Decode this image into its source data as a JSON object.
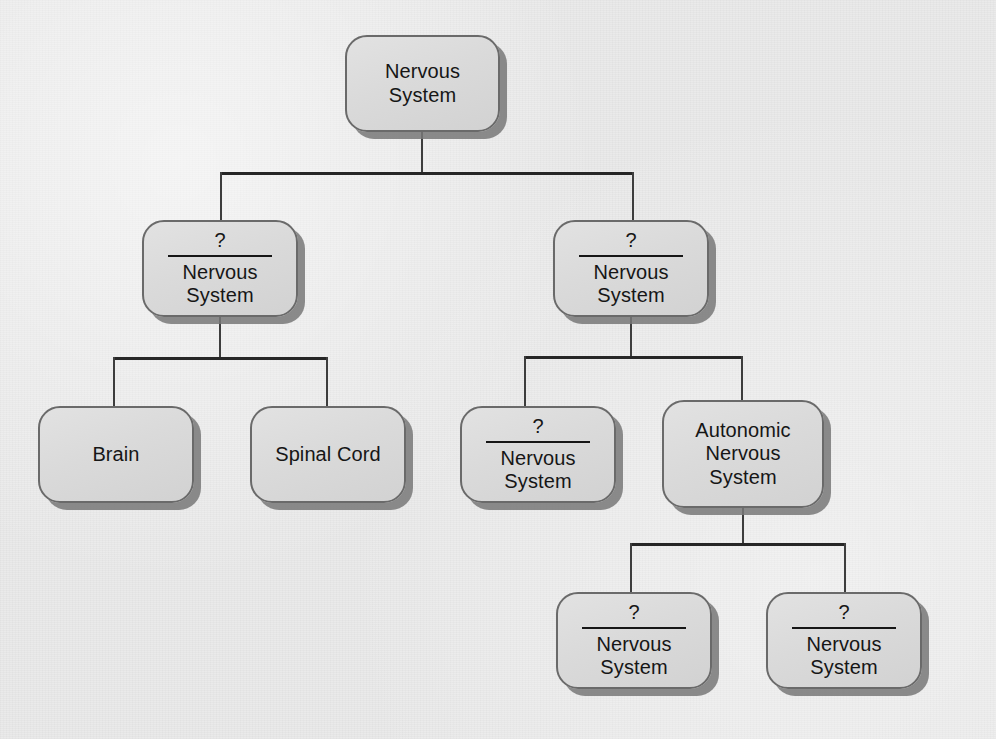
{
  "diagram": {
    "background_color": "#eaeaea",
    "node_fill_color": "#dcdcdc",
    "node_border_color": "#6a6a6a",
    "node_shadow_color": "#787878",
    "connector_color": "#262626",
    "text_color": "#161616",
    "blank_marker": "?",
    "nodes": [
      {
        "id": "root",
        "label": "Nervous\nSystem",
        "blank": false,
        "x": 345,
        "y": 35,
        "w": 155,
        "h": 97
      },
      {
        "id": "l2-left",
        "label": "Nervous\nSystem",
        "blank": true,
        "blank_mark": "?",
        "x": 142,
        "y": 220,
        "w": 156,
        "h": 97
      },
      {
        "id": "l2-right",
        "label": "Nervous\nSystem",
        "blank": true,
        "blank_mark": "?",
        "x": 553,
        "y": 220,
        "w": 156,
        "h": 97
      },
      {
        "id": "brain",
        "label": "Brain",
        "blank": false,
        "x": 38,
        "y": 406,
        "w": 156,
        "h": 97
      },
      {
        "id": "spinal-cord",
        "label": "Spinal Cord",
        "blank": false,
        "x": 250,
        "y": 406,
        "w": 156,
        "h": 97
      },
      {
        "id": "l3-blank",
        "label": "Nervous\nSystem",
        "blank": true,
        "blank_mark": "?",
        "x": 460,
        "y": 406,
        "w": 156,
        "h": 97
      },
      {
        "id": "autonomic",
        "label": "Autonomic\nNervous\nSystem",
        "blank": false,
        "x": 662,
        "y": 400,
        "w": 162,
        "h": 108
      },
      {
        "id": "l4-left",
        "label": "Nervous\nSystem",
        "blank": true,
        "blank_mark": "?",
        "x": 556,
        "y": 592,
        "w": 156,
        "h": 97
      },
      {
        "id": "l4-right",
        "label": "Nervous\nSystem",
        "blank": true,
        "blank_mark": "?",
        "x": 766,
        "y": 592,
        "w": 156,
        "h": 97
      }
    ],
    "edges": [
      {
        "id": "root-stem",
        "type": "vertical",
        "x": 421,
        "y": 132,
        "length": 42
      },
      {
        "id": "root-bar",
        "type": "horizontal",
        "x": 220,
        "y": 172,
        "length": 414
      },
      {
        "id": "root-drop-left",
        "type": "vertical",
        "x": 220,
        "y": 172,
        "length": 50
      },
      {
        "id": "root-drop-right",
        "type": "vertical",
        "x": 632,
        "y": 172,
        "length": 50
      },
      {
        "id": "l2l-stem",
        "type": "vertical",
        "x": 219,
        "y": 317,
        "length": 41
      },
      {
        "id": "l2l-bar",
        "type": "horizontal",
        "x": 113,
        "y": 357,
        "length": 215
      },
      {
        "id": "l2l-drop-left",
        "type": "vertical",
        "x": 113,
        "y": 357,
        "length": 51
      },
      {
        "id": "l2l-drop-right",
        "type": "vertical",
        "x": 326,
        "y": 357,
        "length": 51
      },
      {
        "id": "l2r-stem",
        "type": "vertical",
        "x": 630,
        "y": 317,
        "length": 40
      },
      {
        "id": "l2r-bar",
        "type": "horizontal",
        "x": 524,
        "y": 356,
        "length": 219
      },
      {
        "id": "l2r-drop-left",
        "type": "vertical",
        "x": 524,
        "y": 356,
        "length": 52
      },
      {
        "id": "l2r-drop-right",
        "type": "vertical",
        "x": 741,
        "y": 356,
        "length": 46
      },
      {
        "id": "auto-stem",
        "type": "vertical",
        "x": 742,
        "y": 508,
        "length": 36
      },
      {
        "id": "auto-bar",
        "type": "horizontal",
        "x": 630,
        "y": 543,
        "length": 216
      },
      {
        "id": "auto-drop-left",
        "type": "vertical",
        "x": 630,
        "y": 543,
        "length": 51
      },
      {
        "id": "auto-drop-right",
        "type": "vertical",
        "x": 844,
        "y": 543,
        "length": 51
      }
    ]
  }
}
